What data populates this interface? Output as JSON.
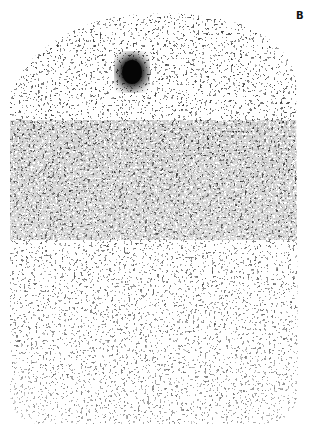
{
  "figure": {
    "panel_label": "B",
    "image_description": "grainy nuclear scintigraphy scan with dense speckled texture and a dark focal hotspot near upper center",
    "colors": {
      "background": "#ffffff",
      "speckle": "#111111"
    },
    "hotspot": {
      "cx": 132,
      "cy": 72,
      "r": 16
    }
  }
}
